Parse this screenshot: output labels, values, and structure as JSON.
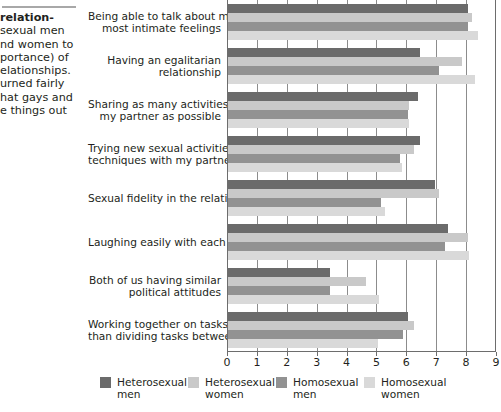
{
  "caption": {
    "rule": "divider",
    "lines": [
      "relation-",
      "sexual men",
      "nd women to",
      "portance) of",
      "elationships.",
      "urned fairly",
      "hat gays and",
      "e things out"
    ],
    "bold_first_line": "relation-"
  },
  "chart_data": {
    "type": "bar",
    "orientation": "horizontal",
    "title": "",
    "xlabel": "",
    "ylabel": "",
    "xlim": [
      0,
      9
    ],
    "xticks": [
      0,
      1,
      2,
      3,
      4,
      5,
      6,
      7,
      8,
      9
    ],
    "xtick_labels": [
      "0",
      "1",
      "2",
      "3",
      "4",
      "5",
      "6",
      "7",
      "8",
      "9"
    ],
    "grid": true,
    "legend_position": "bottom",
    "categories": [
      "Being able to talk about my\nmost intimate feelings",
      "Having an egalitarian\nrelationship",
      "Sharing as many activities with\nmy partner as possible",
      "Trying new sexual activities or\ntechniques with my partner",
      "Sexual fidelity in the relationship",
      "Laughing easily with each other",
      "Both of us having similar\npolitical attitudes",
      "Working together on tasks rather\nthan dividing tasks between us"
    ],
    "series": [
      {
        "name": "Heterosexual\nmen",
        "legend_label": "Heterosexual men",
        "color": "#6b6b6b",
        "values": [
          8.05,
          6.45,
          6.4,
          6.45,
          6.95,
          7.4,
          3.45,
          6.05
        ]
      },
      {
        "name": "Heterosexual\nwomen",
        "legend_label": "Heterosexual women",
        "color": "#c9c9c9",
        "values": [
          8.2,
          7.85,
          6.1,
          6.25,
          7.1,
          8.05,
          4.65,
          6.25
        ]
      },
      {
        "name": "Homosexual\nmen",
        "legend_label": "Homosexual men",
        "color": "#929292",
        "values": [
          8.05,
          7.1,
          6.05,
          5.8,
          5.15,
          7.3,
          3.45,
          5.9
        ]
      },
      {
        "name": "Homosexual\nwomen",
        "legend_label": "Homosexual women",
        "color": "#d9d9d9",
        "values": [
          8.4,
          8.3,
          6.1,
          5.85,
          5.3,
          8.1,
          5.1,
          5.05
        ]
      }
    ]
  },
  "legend": {
    "items": [
      {
        "label": "Heterosexual\nmen",
        "color": "#6b6b6b"
      },
      {
        "label": "Heterosexual\nwomen",
        "color": "#c9c9c9"
      },
      {
        "label": "Homosexual\nmen",
        "color": "#929292"
      },
      {
        "label": "Homosexual\nwomen",
        "color": "#d9d9d9"
      }
    ]
  },
  "axis": {
    "line_color": "#6d6d6d",
    "grid_color": "#8c8c8c"
  }
}
